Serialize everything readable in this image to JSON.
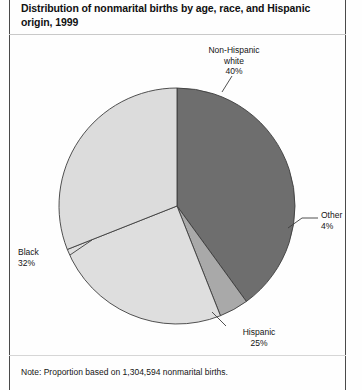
{
  "figure": {
    "title": "Distribution of nonmarital births by age, race, and Hispanic origin, 1999",
    "footnote": "Note: Proportion based on 1,304,594 nonmarital births."
  },
  "labels": {
    "non_hispanic_white": "Non-Hispanic\nwhite\n40%",
    "other": "Other\n4%",
    "hispanic": "Hispanic\n25%",
    "black": "Black\n32%"
  },
  "colors": {
    "non_hispanic_white": "#6e6e6e",
    "other": "#a9a9a9",
    "hispanic": "#dedede",
    "black": "#dcdcdc",
    "outline": "#3d3d3d",
    "leader": "#3d3d3d",
    "frame": "#4a4a4a",
    "text": "#141414"
  },
  "chart_data": {
    "type": "pie",
    "title": "Distribution of nonmarital births by age, race, and Hispanic origin, 1999",
    "subtitle": "",
    "xlabel": "",
    "ylabel": "",
    "legend_position": "none",
    "grid": false,
    "units": "percent",
    "total_label": "1,304,594 nonmarital births",
    "total": 1304594,
    "start_angle_deg": 0,
    "direction": "clockwise",
    "categories": [
      "Non-Hispanic white",
      "Other",
      "Hispanic",
      "Black"
    ],
    "values": [
      40,
      4,
      25,
      32
    ],
    "slices": [
      {
        "name": "Non-Hispanic white",
        "label": "Non-Hispanic white",
        "value": 40,
        "value_label": "40%",
        "color": "#6e6e6e",
        "start_deg": 0,
        "end_deg": 144
      },
      {
        "name": "Other",
        "label": "Other",
        "value": 4,
        "value_label": "4%",
        "color": "#a9a9a9",
        "start_deg": 144,
        "end_deg": 158.4
      },
      {
        "name": "Hispanic",
        "label": "Hispanic",
        "value": 25,
        "value_label": "25%",
        "color": "#dedede",
        "start_deg": 158.4,
        "end_deg": 248.4
      },
      {
        "name": "Black",
        "label": "Black",
        "value": 32,
        "value_label": "32%",
        "color": "#dcdcdc",
        "start_deg": 248.4,
        "end_deg": 360
      }
    ],
    "annotations": [
      "Non-Hispanic white 40%",
      "Other 4%",
      "Hispanic 25%",
      "Black 32%"
    ]
  }
}
